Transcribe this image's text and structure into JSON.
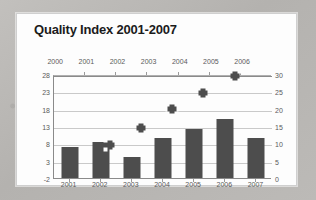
{
  "chart_data": {
    "type": "bar",
    "title": "Quality Index 2001-2007",
    "xlabel": "",
    "ylabel": "",
    "grid": true,
    "legend": "none",
    "categories": [
      "2001",
      "2002",
      "2003",
      "2004",
      "2005",
      "2006",
      "2007"
    ],
    "series": [
      {
        "name": "Bars",
        "type": "bar",
        "axis": "right",
        "values": [
          9,
          10.5,
          6,
          11.5,
          14,
          17,
          11.5
        ]
      },
      {
        "name": "Markers",
        "type": "scatter",
        "axis": "left",
        "x": [
          "2001",
          "2002",
          "2003",
          "2004",
          "2005",
          "2006"
        ],
        "values": [
          null,
          7.5,
          12.5,
          18,
          22.5,
          27.5
        ]
      }
    ],
    "left_axis": {
      "ticks": [
        "28",
        "23",
        "18",
        "13",
        "8",
        "3",
        "-2"
      ],
      "min": -2,
      "max": 28
    },
    "right_axis": {
      "ticks": [
        "30",
        "25",
        "20",
        "15",
        "10",
        "5",
        "0"
      ],
      "min": 0,
      "max": 30
    },
    "top_axis": {
      "ticks": [
        "2000",
        "2001",
        "2002",
        "2003",
        "2004",
        "2005",
        "2006"
      ]
    },
    "bottom_axis": {
      "ticks": [
        "2001",
        "2002",
        "2003",
        "2004",
        "2005",
        "2006",
        "2007"
      ]
    },
    "colors": {
      "bar": "#4d4d4d",
      "marker": "#4d4d4d",
      "grid": "#c9c9c9",
      "axis": "#8a8a8a",
      "plot_background": "#fdfdfd",
      "page_background": "#b9b7b4",
      "title_text": "#1b1b1b",
      "tick_text": "#5b5b5b"
    }
  }
}
